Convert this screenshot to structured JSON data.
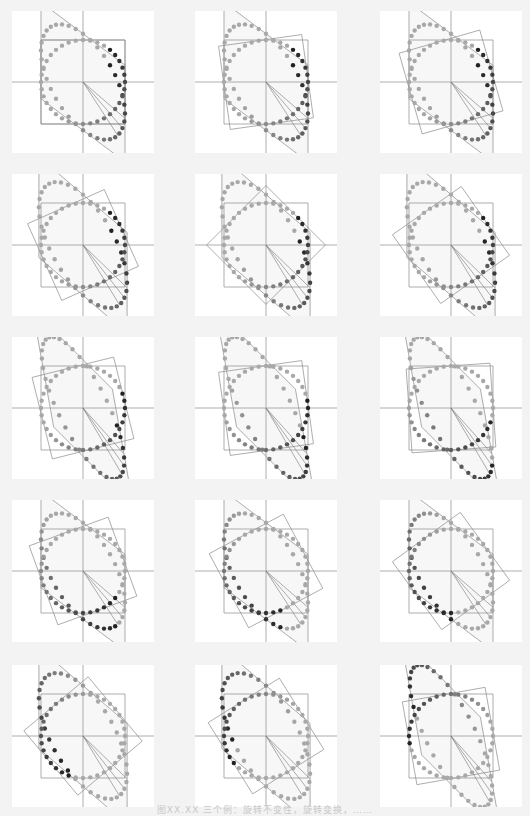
{
  "figure": {
    "caption": "图XX.XX  三个例：旋转不变性，旋转变换，……",
    "colors": {
      "background": "#f3f3f3",
      "panel": "#ffffff",
      "axis": "#9a9a9a",
      "shape_line": "#8a8a8a",
      "dot_light": "#a8a8a8",
      "dot_dark": "#1e1e1e",
      "fill": "#e9e9e9"
    },
    "panels": [
      {
        "id": "r1c1",
        "matrix": [
          [
            1.0,
            0.0
          ],
          [
            -0.75,
            1.15
          ]
        ],
        "square_rotation_deg": 0,
        "dark_start_fraction": 0.1
      },
      {
        "id": "r1c2",
        "matrix": [
          [
            1.0,
            0.0
          ],
          [
            -0.75,
            1.15
          ]
        ],
        "square_rotation_deg": 8,
        "dark_start_fraction": 0.1
      },
      {
        "id": "r1c3",
        "matrix": [
          [
            1.0,
            0.0
          ],
          [
            -0.75,
            1.15
          ]
        ],
        "square_rotation_deg": 16,
        "dark_start_fraction": 0.1
      },
      {
        "id": "r2c1",
        "matrix": [
          [
            1.05,
            0.0
          ],
          [
            -0.9,
            1.2
          ]
        ],
        "square_rotation_deg": 24,
        "dark_start_fraction": 0.1
      },
      {
        "id": "r2c2",
        "matrix": [
          [
            1.05,
            0.0
          ],
          [
            -0.9,
            1.2
          ]
        ],
        "square_rotation_deg": 45,
        "dark_start_fraction": 0.12
      },
      {
        "id": "r2c3",
        "matrix": [
          [
            1.05,
            0.0
          ],
          [
            -0.9,
            1.2
          ]
        ],
        "square_rotation_deg": 35,
        "dark_start_fraction": 0.12
      },
      {
        "id": "r3c1",
        "matrix": [
          [
            0.95,
            -0.25
          ],
          [
            -0.95,
            1.4
          ]
        ],
        "square_rotation_deg": 14,
        "dark_start_fraction": 0.18
      },
      {
        "id": "r3c2",
        "matrix": [
          [
            0.95,
            -0.25
          ],
          [
            -0.95,
            1.4
          ]
        ],
        "square_rotation_deg": 8,
        "dark_start_fraction": 0.22
      },
      {
        "id": "r3c3",
        "matrix": [
          [
            0.95,
            -0.25
          ],
          [
            -0.95,
            1.4
          ]
        ],
        "square_rotation_deg": 4,
        "dark_start_fraction": 0.28
      },
      {
        "id": "r4c1",
        "matrix": [
          [
            1.0,
            0.0
          ],
          [
            -0.75,
            1.15
          ]
        ],
        "square_rotation_deg": 20,
        "dark_start_fraction": 0.35
      },
      {
        "id": "r4c2",
        "matrix": [
          [
            1.0,
            0.0
          ],
          [
            -0.75,
            1.15
          ]
        ],
        "square_rotation_deg": 28,
        "dark_start_fraction": 0.42
      },
      {
        "id": "r4c3",
        "matrix": [
          [
            1.0,
            0.0
          ],
          [
            -0.75,
            1.15
          ]
        ],
        "square_rotation_deg": 36,
        "dark_start_fraction": 0.48
      },
      {
        "id": "r5c1",
        "matrix": [
          [
            1.05,
            0.0
          ],
          [
            -0.9,
            1.2
          ]
        ],
        "square_rotation_deg": 40,
        "dark_start_fraction": 0.55
      },
      {
        "id": "r5c2",
        "matrix": [
          [
            1.05,
            0.0
          ],
          [
            -0.9,
            1.2
          ]
        ],
        "square_rotation_deg": 32,
        "dark_start_fraction": 0.62
      },
      {
        "id": "r5c3",
        "matrix": [
          [
            0.95,
            -0.25
          ],
          [
            -0.95,
            1.4
          ]
        ],
        "square_rotation_deg": 10,
        "dark_start_fraction": 0.7
      }
    ]
  }
}
